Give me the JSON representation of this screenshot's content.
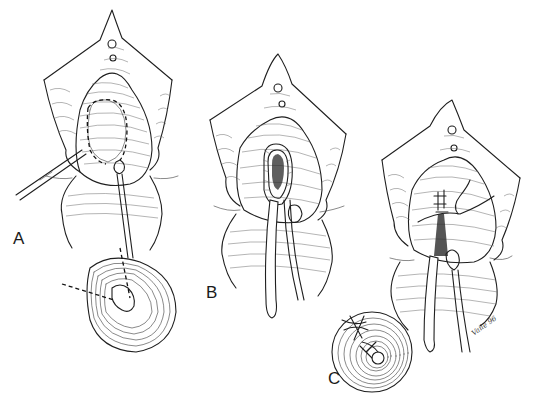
{
  "figure": {
    "type": "surgical line illustration",
    "style": "black ink on white",
    "background": "#ffffff",
    "ink_color": "#1f1f1f"
  },
  "panels": [
    {
      "id": "A",
      "label": "A",
      "label_position": {
        "x": 13,
        "y": 232
      },
      "elements": [
        "labial retractors",
        "dashed elliptical incision outline",
        "scalpel/instrument from left",
        "catheter",
        "cross-section with dashed incision lines"
      ]
    },
    {
      "id": "B",
      "label": "B",
      "label_position": {
        "x": 206,
        "y": 286
      },
      "elements": [
        "retracted labia",
        "opened elliptical cavity with hatched wall",
        "two catheters/tubes"
      ]
    },
    {
      "id": "C",
      "label": "C",
      "label_position": {
        "x": 328,
        "y": 372
      },
      "elements": [
        "retracted labia",
        "sutured closure",
        "suture thread",
        "two catheters",
        "cross-section with sutures"
      ]
    }
  ],
  "signature": {
    "text": "Vaile 96"
  }
}
